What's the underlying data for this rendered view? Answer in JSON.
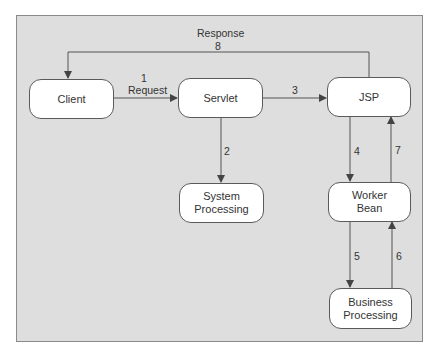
{
  "diagram": {
    "colors": {
      "background": "#dedede",
      "node_fill": "#ffffff",
      "line": "#555555",
      "text": "#333333"
    },
    "nodes": {
      "client": "Client",
      "servlet": "Servlet",
      "jsp": "JSP",
      "system_processing": "System\nProcessing",
      "worker_bean": "Worker\nBean",
      "business_processing": "Business\nProcessing"
    },
    "edges": [
      {
        "id": "e1",
        "from": "client",
        "to": "servlet",
        "step": "1",
        "label": "Request"
      },
      {
        "id": "e2",
        "from": "servlet",
        "to": "system_processing",
        "step": "2",
        "label": ""
      },
      {
        "id": "e3",
        "from": "servlet",
        "to": "jsp",
        "step": "3",
        "label": ""
      },
      {
        "id": "e4",
        "from": "jsp",
        "to": "worker_bean",
        "step": "4",
        "label": ""
      },
      {
        "id": "e5",
        "from": "worker_bean",
        "to": "business_processing",
        "step": "5",
        "label": ""
      },
      {
        "id": "e6",
        "from": "business_processing",
        "to": "worker_bean",
        "step": "6",
        "label": ""
      },
      {
        "id": "e7",
        "from": "worker_bean",
        "to": "jsp",
        "step": "7",
        "label": ""
      },
      {
        "id": "e8",
        "from": "jsp",
        "to": "client",
        "step": "8",
        "label": "Response"
      }
    ]
  }
}
